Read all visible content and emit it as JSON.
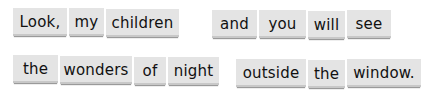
{
  "sentence_lines": [
    {
      "words": [
        {
          "text": "Look,",
          "x": 13,
          "y": 8,
          "w": 54
        },
        {
          "text": "my",
          "x": 69,
          "y": 8,
          "w": 35
        },
        {
          "text": "children",
          "x": 106,
          "y": 9,
          "w": 73
        },
        {
          "text": "and",
          "x": 212,
          "y": 10,
          "w": 45
        },
        {
          "text": "you",
          "x": 259,
          "y": 10,
          "w": 47
        },
        {
          "text": "will",
          "x": 308,
          "y": 11,
          "w": 37
        },
        {
          "text": "see",
          "x": 347,
          "y": 10,
          "w": 44
        }
      ]
    },
    {
      "words": [
        {
          "text": "the",
          "x": 13,
          "y": 55,
          "w": 45
        },
        {
          "text": "wonders",
          "x": 60,
          "y": 56,
          "w": 72
        },
        {
          "text": "of",
          "x": 134,
          "y": 57,
          "w": 32
        },
        {
          "text": "night",
          "x": 168,
          "y": 57,
          "w": 51
        },
        {
          "text": "outside",
          "x": 236,
          "y": 59,
          "w": 70
        },
        {
          "text": "the",
          "x": 308,
          "y": 60,
          "w": 37
        },
        {
          "text": "window.",
          "x": 347,
          "y": 59,
          "w": 74
        }
      ]
    }
  ]
}
